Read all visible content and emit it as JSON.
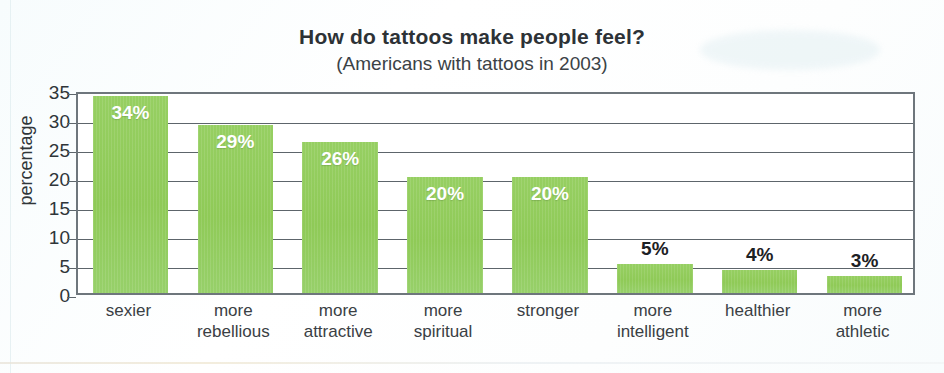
{
  "chart_data": {
    "type": "bar",
    "title": "How do tattoos make people feel?",
    "subtitle": "(Americans with tattoos in 2003)",
    "xlabel": "",
    "ylabel": "percentage",
    "ylim": [
      0,
      35
    ],
    "ytick_step": 5,
    "yticks": [
      35,
      30,
      25,
      20,
      15,
      10,
      5,
      0
    ],
    "grid": "horizontal",
    "legend": "none",
    "bar_color": "#92cc5e",
    "label_color_inside": "#ffffff",
    "label_color_outside": "#1d2124",
    "categories": [
      "sexier",
      "more rebellious",
      "more attractive",
      "more spiritual",
      "stronger",
      "more intelligent",
      "healthier",
      "more athletic"
    ],
    "category_lines": [
      [
        "sexier",
        ""
      ],
      [
        "more",
        "rebellious"
      ],
      [
        "more",
        "attractive"
      ],
      [
        "more",
        "spiritual"
      ],
      [
        "stronger",
        ""
      ],
      [
        "more",
        "intelligent"
      ],
      [
        "healthier",
        ""
      ],
      [
        "more",
        "athletic"
      ]
    ],
    "values": [
      34,
      29,
      26,
      20,
      20,
      5,
      4,
      3
    ],
    "data_labels": [
      "34%",
      "29%",
      "26%",
      "20%",
      "20%",
      "5%",
      "4%",
      "3%"
    ],
    "label_placement": [
      "inside",
      "inside",
      "inside",
      "inside",
      "inside",
      "above",
      "above",
      "above"
    ]
  }
}
